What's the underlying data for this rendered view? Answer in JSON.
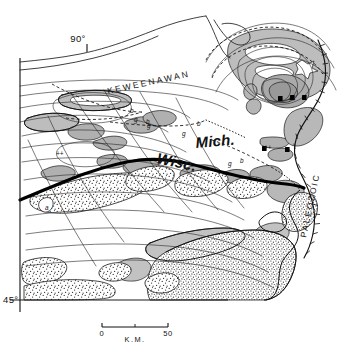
{
  "figure": {
    "kind": "geologic-sketch-map",
    "region_labels": {
      "keweenawan": "KEWEENAWAN",
      "paleozoic": "PALEOZOIC",
      "michigan": "Mich.",
      "wisconsin": "Wisc."
    },
    "graticule": {
      "meridian_label": "90°",
      "parallel_label": "45°"
    },
    "scale_bar": {
      "left_label": "0",
      "right_label": "50",
      "units_label": "K.M."
    },
    "unit_letters": [
      {
        "id": "u1",
        "text": "b",
        "x": 130,
        "y": 113
      },
      {
        "id": "u2",
        "text": "g",
        "x": 134,
        "y": 122
      },
      {
        "id": "u3",
        "text": "b",
        "x": 146,
        "y": 124
      },
      {
        "id": "u4",
        "text": "g",
        "x": 147,
        "y": 128
      },
      {
        "id": "u5",
        "text": "b",
        "x": 197,
        "y": 126
      },
      {
        "id": "u6",
        "text": "g",
        "x": 182,
        "y": 136
      },
      {
        "id": "u7",
        "text": "b",
        "x": 240,
        "y": 163
      },
      {
        "id": "u8",
        "text": "g",
        "x": 228,
        "y": 166
      },
      {
        "id": "u9",
        "text": "a",
        "x": 45,
        "y": 210
      },
      {
        "id": "u10",
        "text": "++",
        "x": 60,
        "y": 154
      },
      {
        "id": "u11",
        "text": "++",
        "x": 290,
        "y": 100
      },
      {
        "id": "u12",
        "text": "++",
        "x": 265,
        "y": 147
      }
    ],
    "colors": {
      "ink": "#111111",
      "line": "#1a1a1a",
      "gray_unit": "#b9b9b9",
      "gray_unit_light": "#d2d2d2",
      "stipple": "#3a3a3a",
      "paper": "#ffffff"
    }
  }
}
